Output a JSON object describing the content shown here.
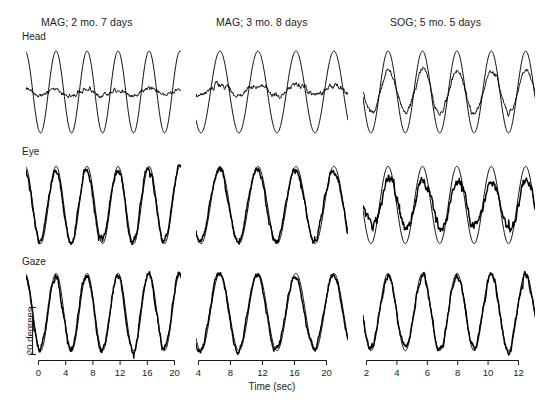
{
  "figure": {
    "units_label": "20 degrees",
    "xaxis_title": "Time (sec)",
    "columns": [
      {
        "title": "MAG; 2 mo. 7 days",
        "ticks": [
          "0",
          "4",
          "8",
          "12",
          "16",
          "20"
        ]
      },
      {
        "title": "MAG; 3 mo. 8 days",
        "ticks": [
          "4",
          "8",
          "12",
          "16",
          "20"
        ]
      },
      {
        "title": "SOG; 5 mo. 5 days",
        "ticks": [
          "2",
          "4",
          "6",
          "8",
          "10",
          "12"
        ]
      }
    ],
    "rows": [
      {
        "label": "Head"
      },
      {
        "label": "Eye"
      },
      {
        "label": "Gaze"
      }
    ]
  },
  "chart_data": {
    "type": "line",
    "title": "",
    "xlabel": "Time (sec)",
    "ylabel": "20 degrees",
    "grid": false,
    "legend": "none",
    "stroke_color": "#000000",
    "panels": [
      {
        "column": "MAG; 2 mo. 7 days",
        "row": "Head",
        "xlim": [
          0,
          21
        ],
        "ylim": [
          -22,
          22
        ],
        "series": [
          {
            "name": "stimulus",
            "waveform": "sine",
            "cycles": 5.0,
            "amplitude": 18,
            "phase": 0.28,
            "offset": 0,
            "noise": 0.0,
            "thick": false
          },
          {
            "name": "head",
            "waveform": "sine",
            "cycles": 5.0,
            "amplitude": 1.3,
            "phase": 0.28,
            "offset": 0,
            "noise": 0.9,
            "thick": false
          }
        ]
      },
      {
        "column": "MAG; 2 mo. 7 days",
        "row": "Eye",
        "xlim": [
          0,
          21
        ],
        "ylim": [
          -22,
          22
        ],
        "series": [
          {
            "name": "stimulus",
            "waveform": "sine",
            "cycles": 5.0,
            "amplitude": 17,
            "phase": 0.28,
            "offset": 0,
            "noise": 0.0,
            "thick": false
          },
          {
            "name": "eye",
            "waveform": "sine",
            "cycles": 5.0,
            "amplitude": 16,
            "phase": 0.3,
            "offset": 0,
            "noise": 1.4,
            "thick": true
          }
        ]
      },
      {
        "column": "MAG; 2 mo. 7 days",
        "row": "Gaze",
        "xlim": [
          0,
          21
        ],
        "ylim": [
          -22,
          22
        ],
        "series": [
          {
            "name": "stimulus",
            "waveform": "sine",
            "cycles": 5.0,
            "amplitude": 17,
            "phase": 0.28,
            "offset": 0,
            "noise": 0.0,
            "thick": false
          },
          {
            "name": "gaze",
            "waveform": "sine",
            "cycles": 5.0,
            "amplitude": 16.5,
            "phase": 0.3,
            "offset": 0,
            "noise": 1.5,
            "thick": true
          }
        ]
      },
      {
        "column": "MAG; 3 mo. 8 days",
        "row": "Head",
        "xlim": [
          2,
          21
        ],
        "ylim": [
          -22,
          22
        ],
        "series": [
          {
            "name": "stimulus",
            "waveform": "sine",
            "cycles": 4.0,
            "amplitude": 18,
            "phase": 0.62,
            "offset": 0,
            "noise": 0.0,
            "thick": false
          },
          {
            "name": "head",
            "waveform": "sine",
            "cycles": 4.0,
            "amplitude": 2.6,
            "phase": 0.62,
            "offset": 1.0,
            "noise": 1.1,
            "thick": false
          }
        ]
      },
      {
        "column": "MAG; 3 mo. 8 days",
        "row": "Eye",
        "xlim": [
          2,
          21
        ],
        "ylim": [
          -22,
          22
        ],
        "series": [
          {
            "name": "stimulus",
            "waveform": "sine",
            "cycles": 4.0,
            "amplitude": 17,
            "phase": 0.62,
            "offset": 0,
            "noise": 0.0,
            "thick": false
          },
          {
            "name": "eye",
            "waveform": "sine",
            "cycles": 4.0,
            "amplitude": 16,
            "phase": 0.64,
            "offset": 0,
            "noise": 1.4,
            "thick": true
          }
        ]
      },
      {
        "column": "MAG; 3 mo. 8 days",
        "row": "Gaze",
        "xlim": [
          2,
          21
        ],
        "ylim": [
          -22,
          22
        ],
        "series": [
          {
            "name": "stimulus",
            "waveform": "sine",
            "cycles": 4.0,
            "amplitude": 17,
            "phase": 0.62,
            "offset": 0,
            "noise": 0.0,
            "thick": false
          },
          {
            "name": "gaze",
            "waveform": "sine",
            "cycles": 4.0,
            "amplitude": 16.5,
            "phase": 0.64,
            "offset": 0,
            "noise": 1.3,
            "thick": true
          }
        ]
      },
      {
        "column": "SOG; 5 mo. 5 days",
        "row": "Head",
        "xlim": [
          1,
          13.5
        ],
        "ylim": [
          -22,
          22
        ],
        "series": [
          {
            "name": "stimulus",
            "waveform": "sine",
            "cycles": 5.0,
            "amplitude": 18,
            "phase": 0.52,
            "offset": 0,
            "noise": 0.0,
            "thick": false
          },
          {
            "name": "head",
            "waveform": "sine",
            "cycles": 5.0,
            "amplitude": 9.5,
            "phase": 0.5,
            "offset": 0,
            "noise": 1.2,
            "thick": false
          }
        ]
      },
      {
        "column": "SOG; 5 mo. 5 days",
        "row": "Eye",
        "xlim": [
          1,
          13.5
        ],
        "ylim": [
          -22,
          22
        ],
        "series": [
          {
            "name": "stimulus",
            "waveform": "sine",
            "cycles": 5.0,
            "amplitude": 17,
            "phase": 0.52,
            "offset": 0,
            "noise": 0.0,
            "thick": false
          },
          {
            "name": "eye",
            "waveform": "sine",
            "cycles": 5.0,
            "amplitude": 10.5,
            "phase": 0.48,
            "offset": 0,
            "noise": 2.2,
            "thick": true
          }
        ]
      },
      {
        "column": "SOG; 5 mo. 5 days",
        "row": "Gaze",
        "xlim": [
          1,
          13.5
        ],
        "ylim": [
          -22,
          22
        ],
        "series": [
          {
            "name": "stimulus",
            "waveform": "sine",
            "cycles": 5.0,
            "amplitude": 17,
            "phase": 0.52,
            "offset": 0,
            "noise": 0.0,
            "thick": false
          },
          {
            "name": "gaze",
            "waveform": "sine",
            "cycles": 5.0,
            "amplitude": 16.0,
            "phase": 0.52,
            "offset": 0,
            "noise": 1.6,
            "thick": true
          }
        ]
      }
    ]
  }
}
